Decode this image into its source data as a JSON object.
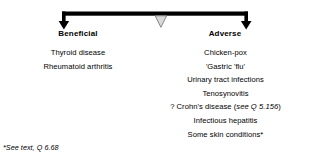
{
  "diagram": {
    "type": "balance-scale",
    "colors": {
      "beam": "#000000",
      "fulcrum_fill": "#d9d9d9",
      "fulcrum_stroke": "#7a7a7a",
      "text": "#000000",
      "background": "#ffffff"
    },
    "sides": [
      {
        "id": "beneficial",
        "heading": "Beneficial",
        "arrow": "down-arrow-icon",
        "items": [
          {
            "text": "Thyroid disease"
          },
          {
            "text": "Rheumatoid arthritis"
          }
        ]
      },
      {
        "id": "adverse",
        "heading": "Adverse",
        "arrow": "down-arrow-icon",
        "items": [
          {
            "text": "Chicken-pox"
          },
          {
            "text": "'Gastric 'flu'"
          },
          {
            "text": "Urinary tract infections"
          },
          {
            "text": "Tenosynovitis"
          },
          {
            "text": "? Crohn's disease (see Q 5.156)",
            "prefix": "? Crohn's disease (",
            "italic": "see Q 5.156",
            "suffix": ")"
          },
          {
            "text": "Infectious hepatitis"
          },
          {
            "text": "Some skin conditions*"
          }
        ]
      }
    ],
    "footnote": "*See text, Q 6.68"
  }
}
